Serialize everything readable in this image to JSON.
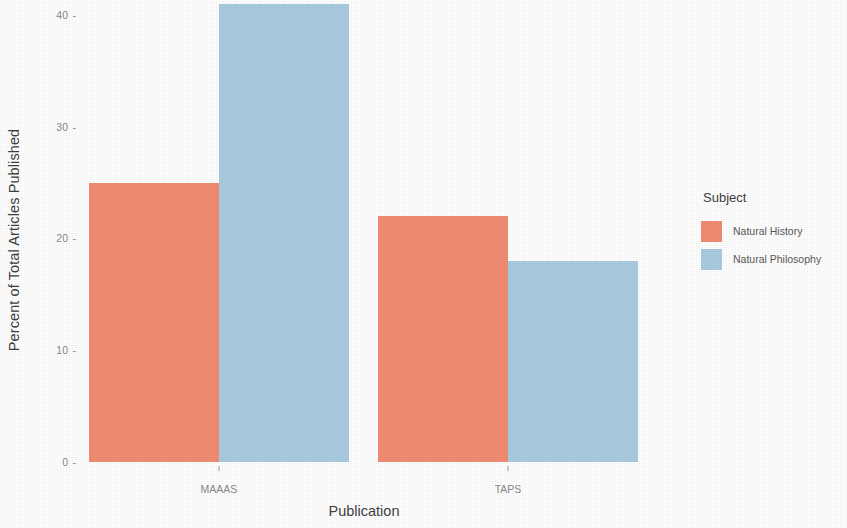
{
  "chart_data": {
    "type": "bar",
    "title": "",
    "subtitle": "",
    "xlabel": "Publication",
    "ylabel": "Percent of Total Articles Published",
    "categories": [
      "MAAAS",
      "TAPS"
    ],
    "series": [
      {
        "name": "Natural History",
        "color": "#F28D74",
        "values": [
          25,
          22
        ]
      },
      {
        "name": "Natural Philosophy",
        "color": "#AACCE2",
        "values": [
          41,
          18
        ]
      }
    ],
    "ylim": [
      0,
      41
    ],
    "yticks": [
      0,
      10,
      20,
      30,
      40
    ],
    "ytick_labels": [
      "0",
      "10",
      "20",
      "30",
      "40"
    ],
    "grid": false,
    "legend": {
      "title": "Subject",
      "position": "right"
    },
    "bar_mode": "grouped",
    "note": "Top of the MAAAS Natural Philosophy bar is clipped by the image edge"
  },
  "axes": {
    "y_title": "Percent of Total Articles Published",
    "x_title": "Publication",
    "tick_glyph": "-"
  },
  "legend": {
    "title": "Subject",
    "entries": [
      {
        "label": "Natural History",
        "color": "#F28D74"
      },
      {
        "label": "Natural Philosophy",
        "color": "#AACCE2"
      }
    ]
  },
  "colors": {
    "natural_history": "#F28D74",
    "natural_philosophy": "#AACCE2",
    "background": "#FFFFFF",
    "text": "#4D4D4D",
    "tick_text": "#8A8A8A"
  }
}
